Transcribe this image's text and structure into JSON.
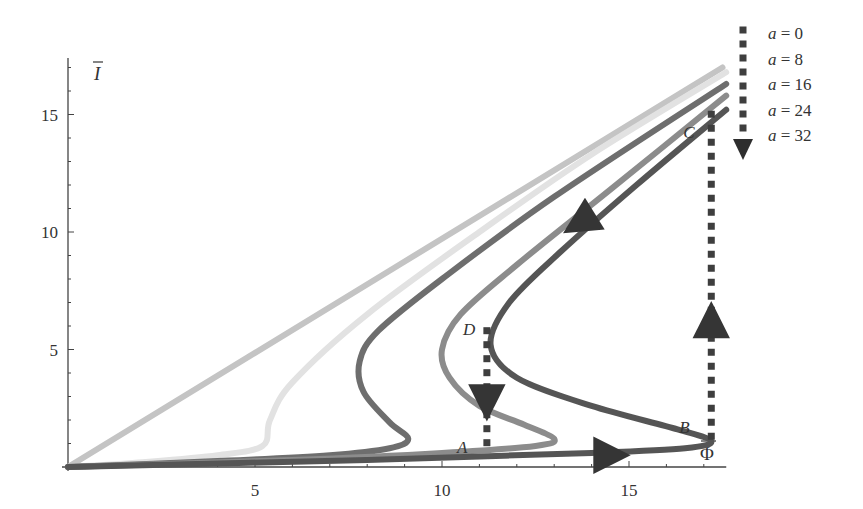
{
  "chart_data": {
    "type": "line",
    "title": "",
    "xlabel": "Φ̄",
    "ylabel": "Ī",
    "xlim": [
      0,
      18
    ],
    "ylim": [
      0,
      17
    ],
    "x_ticks": [
      5,
      10,
      15
    ],
    "y_ticks": [
      5,
      10,
      15
    ],
    "x_tick_labels": [
      "5",
      "10",
      "15"
    ],
    "y_tick_labels": [
      "5",
      "10",
      "15"
    ],
    "grid": false,
    "legend_position": "top-right",
    "legend_arrow_note": "dotted arrow pointing down indicates increasing a",
    "series": [
      {
        "name": "a = 0",
        "color": "#c4c4c4",
        "points": [
          [
            0,
            0
          ],
          [
            17.5,
            17.0
          ]
        ]
      },
      {
        "name": "a = 8",
        "color": "#e2e2e2",
        "points": [
          [
            0,
            0
          ],
          [
            2,
            0.2
          ],
          [
            4,
            0.5
          ],
          [
            5.2,
            0.9
          ],
          [
            5.4,
            2.0
          ],
          [
            6,
            3.6
          ],
          [
            8,
            6.5
          ],
          [
            11,
            10.0
          ],
          [
            14,
            13.3
          ],
          [
            17.6,
            16.8
          ]
        ]
      },
      {
        "name": "a = 16",
        "color": "#6e6e6e",
        "points": [
          [
            0,
            0
          ],
          [
            4,
            0.25
          ],
          [
            7,
            0.5
          ],
          [
            8.6,
            0.8
          ],
          [
            9.1,
            1.2
          ],
          [
            8.6,
            1.9
          ],
          [
            7.9,
            3.2
          ],
          [
            7.8,
            4.5
          ],
          [
            8.3,
            5.8
          ],
          [
            10,
            8.0
          ],
          [
            13,
            11.5
          ],
          [
            17.6,
            16.3
          ]
        ]
      },
      {
        "name": "a = 24",
        "color": "#8c8c8c",
        "points": [
          [
            0,
            0
          ],
          [
            6,
            0.3
          ],
          [
            10,
            0.6
          ],
          [
            12.5,
            0.9
          ],
          [
            13.0,
            1.2
          ],
          [
            12.2,
            1.8
          ],
          [
            11,
            2.6
          ],
          [
            10.2,
            3.8
          ],
          [
            10.0,
            5.0
          ],
          [
            10.5,
            6.5
          ],
          [
            12,
            8.6
          ],
          [
            14.5,
            11.8
          ],
          [
            17.6,
            15.8
          ]
        ]
      },
      {
        "name": "a = 32",
        "color": "#555555",
        "points": [
          [
            0,
            0
          ],
          [
            8,
            0.3
          ],
          [
            14,
            0.6
          ],
          [
            16.5,
            0.8
          ],
          [
            17.2,
            1.1
          ],
          [
            16.3,
            1.6
          ],
          [
            14,
            2.6
          ],
          [
            12.0,
            3.8
          ],
          [
            11.3,
            5.2
          ],
          [
            11.8,
            7.0
          ],
          [
            13.2,
            9.2
          ],
          [
            15.2,
            12.0
          ],
          [
            17.6,
            15.2
          ]
        ]
      }
    ],
    "hysteresis": {
      "points": [
        {
          "label": "A",
          "x": 11.2,
          "y": 0.6
        },
        {
          "label": "B",
          "x": 17.2,
          "y": 1.1
        },
        {
          "label": "C",
          "x": 17.2,
          "y": 14.5
        },
        {
          "label": "D",
          "x": 11.2,
          "y": 5.8
        }
      ],
      "jumps": [
        {
          "from": "B",
          "to": "C",
          "direction": "up",
          "x": 17.2
        },
        {
          "from": "D",
          "to": "A",
          "direction": "down",
          "x": 11.2
        }
      ],
      "flow_arrows": [
        {
          "on": "a = 32",
          "at": [
            14.5,
            0.5
          ],
          "direction": "right"
        },
        {
          "on": "a = 32",
          "at": [
            13.7,
            10.4
          ],
          "direction": "down-left"
        }
      ]
    }
  },
  "legend": {
    "items": [
      "a = 0",
      "a = 8",
      "a = 16",
      "a = 24",
      "a = 32"
    ]
  },
  "axes": {
    "x_title": "Φ",
    "y_title": "I"
  }
}
